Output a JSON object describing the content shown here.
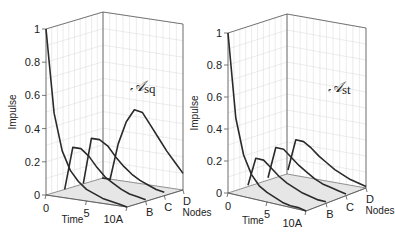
{
  "chart_data": [
    {
      "type": "line",
      "subtype": "3d-waterfall",
      "panel": "left",
      "title": "𝒜sq",
      "title_main": "𝒜",
      "title_sub": "sq",
      "xlabel": "Time",
      "ylabel": "Nodes",
      "zlabel": "Impulse",
      "x_ticks": [
        "0",
        "5",
        "10"
      ],
      "y_ticks": [
        "A",
        "B",
        "C",
        "D"
      ],
      "z_ticks": [
        "0",
        "0.2",
        "0.4",
        "0.6",
        "0.8",
        "1"
      ],
      "zlim": [
        0,
        1
      ],
      "xlim": [
        0,
        10
      ],
      "grid": true,
      "x": [
        0,
        1,
        2,
        3,
        4,
        5,
        6,
        7,
        8,
        9,
        10
      ],
      "series": [
        {
          "name": "A",
          "values": [
            1.0,
            0.5,
            0.28,
            0.17,
            0.11,
            0.07,
            0.05,
            0.03,
            0.02,
            0.01,
            0.0
          ]
        },
        {
          "name": "B",
          "values": [
            0.0,
            0.26,
            0.26,
            0.22,
            0.16,
            0.11,
            0.08,
            0.05,
            0.03,
            0.02,
            0.01
          ]
        },
        {
          "name": "C",
          "values": [
            0.0,
            0.28,
            0.28,
            0.25,
            0.19,
            0.14,
            0.1,
            0.07,
            0.05,
            0.03,
            0.02
          ]
        },
        {
          "name": "D",
          "values": [
            0.0,
            0.0,
            0.22,
            0.36,
            0.44,
            0.43,
            0.36,
            0.29,
            0.22,
            0.16,
            0.1
          ]
        }
      ]
    },
    {
      "type": "line",
      "subtype": "3d-waterfall",
      "panel": "right",
      "title": "𝒜st",
      "title_main": "𝒜",
      "title_sub": "st",
      "xlabel": "Time",
      "ylabel": "Nodes",
      "zlabel": "Impulse",
      "x_ticks": [
        "0",
        "5",
        "10"
      ],
      "y_ticks": [
        "A",
        "B",
        "C",
        "D"
      ],
      "z_ticks": [
        "0",
        "0.2",
        "0.4",
        "0.6",
        "0.8",
        "1"
      ],
      "zlim": [
        0,
        1
      ],
      "xlim": [
        0,
        10
      ],
      "grid": true,
      "x": [
        0,
        1,
        2,
        3,
        4,
        5,
        6,
        7,
        8,
        9,
        10
      ],
      "series": [
        {
          "name": "A",
          "values": [
            1.0,
            0.48,
            0.26,
            0.15,
            0.09,
            0.06,
            0.04,
            0.02,
            0.01,
            0.01,
            0.0
          ]
        },
        {
          "name": "B",
          "values": [
            0.0,
            0.18,
            0.18,
            0.14,
            0.1,
            0.07,
            0.05,
            0.03,
            0.02,
            0.01,
            0.01
          ]
        },
        {
          "name": "C",
          "values": [
            0.0,
            0.2,
            0.2,
            0.16,
            0.12,
            0.09,
            0.06,
            0.04,
            0.03,
            0.02,
            0.01
          ]
        },
        {
          "name": "D",
          "values": [
            0.0,
            0.2,
            0.2,
            0.17,
            0.13,
            0.1,
            0.07,
            0.05,
            0.03,
            0.02,
            0.01
          ]
        }
      ]
    }
  ],
  "panels": [
    {
      "geom": {
        "lf": [
          46,
          195
        ],
        "back": [
          103,
          178
        ],
        "rt": [
          183,
          190
        ],
        "fr": [
          127,
          207
        ],
        "zscale": 166,
        "label_pos": [
          130,
          91
        ]
      }
    },
    {
      "geom": {
        "lf": [
          228,
          193
        ],
        "back": [
          287,
          174
        ],
        "rt": [
          366,
          188
        ],
        "fr": [
          306,
          211
        ],
        "zscale": 160,
        "label_pos": [
          328,
          92
        ]
      }
    }
  ],
  "colors": {
    "curve": "#2a2a2a",
    "axis": "#555555",
    "grid": "#d8d8d8",
    "floor": "#e6e6e6",
    "text": "#222222"
  }
}
